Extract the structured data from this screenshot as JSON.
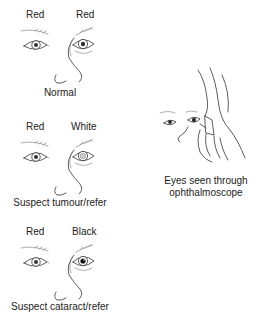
{
  "panels": [
    {
      "left_label": "Red",
      "right_label": "Red",
      "caption": "Normal",
      "right_pupil": "normal"
    },
    {
      "left_label": "Red",
      "right_label": "White",
      "caption": "Suspect tumour/refer",
      "right_pupil": "white"
    },
    {
      "left_label": "Red",
      "right_label": "Black",
      "caption": "Suspect cataract/refer",
      "right_pupil": "black"
    }
  ],
  "side_illustration": {
    "caption_line1": "Eyes seen through",
    "caption_line2": "ophthalmoscope"
  },
  "colors": {
    "line": "#333333",
    "background": "#ffffff"
  }
}
